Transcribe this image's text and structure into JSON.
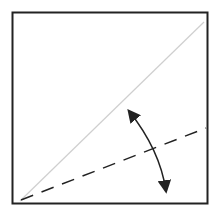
{
  "diagram": {
    "type": "origami-fold",
    "colors": {
      "border": "#222222",
      "diagonal": "#cfcfcf",
      "dashed": "#222222",
      "arrow": "#222222",
      "background": "#ffffff"
    },
    "square": {
      "x": 12,
      "y": 12,
      "width": 196,
      "height": 192
    },
    "diagonal_line": {
      "x1": 20,
      "y1": 201,
      "x2": 204,
      "y2": 22
    },
    "valley_fold_line": {
      "x1": 21,
      "y1": 200,
      "x2": 206,
      "y2": 128
    },
    "fold_arrow": {
      "from": [
        128,
        109
      ],
      "to": [
        166,
        194
      ],
      "bidirectional": true
    }
  }
}
